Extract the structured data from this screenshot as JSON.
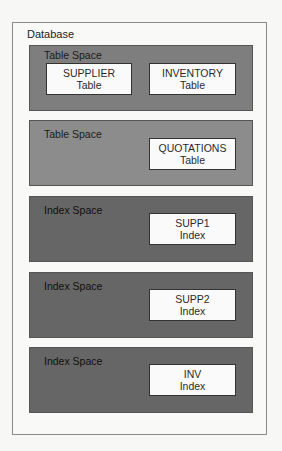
{
  "database": {
    "label": "Database"
  },
  "spaces": [
    {
      "label": "Table Space",
      "kind": "table-space",
      "objects": [
        {
          "name": "SUPPLIER",
          "type": "Table"
        },
        {
          "name": "INVENTORY",
          "type": "Table"
        }
      ]
    },
    {
      "label": "Table Space",
      "kind": "table-space",
      "objects": [
        {
          "name": "QUOTATIONS",
          "type": "Table"
        }
      ]
    },
    {
      "label": "Index Space",
      "kind": "index-space",
      "objects": [
        {
          "name": "SUPP1",
          "type": "Index"
        }
      ]
    },
    {
      "label": "Index Space",
      "kind": "index-space",
      "objects": [
        {
          "name": "SUPP2",
          "type": "Index"
        }
      ]
    },
    {
      "label": "Index Space",
      "kind": "index-space",
      "objects": [
        {
          "name": "INV",
          "type": "Index"
        }
      ]
    }
  ],
  "colors": {
    "table_space_1": "#7e7e7e",
    "table_space_2": "#8c8c8c",
    "index_space": "#666666",
    "object_box": "#fafafa",
    "database_border": "#8a8a8a"
  }
}
